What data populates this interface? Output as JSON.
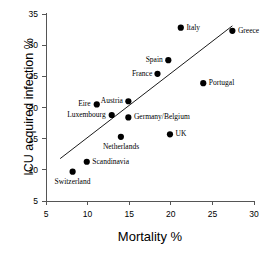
{
  "chart_data": {
    "type": "scatter",
    "title": "",
    "xlabel": "Mortality %",
    "ylabel": "ICU acquired infection %",
    "xlim": [
      5,
      30
    ],
    "ylim": [
      5,
      35
    ],
    "xticks": [
      5,
      10,
      15,
      20,
      25,
      30
    ],
    "yticks": [
      5,
      10,
      15,
      20,
      25,
      30,
      35
    ],
    "grid": false,
    "legend": false,
    "marker_color": "#000000",
    "line_color": "#000000",
    "points": [
      {
        "label": "Switzerland",
        "x": 8.2,
        "y": 9.7,
        "label_pos": "below"
      },
      {
        "label": "Scandinavia",
        "x": 9.9,
        "y": 11.3,
        "label_pos": "right"
      },
      {
        "label": "Eire",
        "x": 11.1,
        "y": 20.5,
        "label_pos": "left"
      },
      {
        "label": "Luxembourg",
        "x": 12.9,
        "y": 18.8,
        "label_pos": "left"
      },
      {
        "label": "Netherlands",
        "x": 14.0,
        "y": 15.3,
        "label_pos": "below"
      },
      {
        "label": "Austria",
        "x": 14.9,
        "y": 21.0,
        "label_pos": "left"
      },
      {
        "label": "Germany/Belgium",
        "x": 14.9,
        "y": 18.4,
        "label_pos": "right"
      },
      {
        "label": "France",
        "x": 18.4,
        "y": 25.4,
        "label_pos": "left"
      },
      {
        "label": "Spain",
        "x": 19.7,
        "y": 27.6,
        "label_pos": "left"
      },
      {
        "label": "UK",
        "x": 19.9,
        "y": 15.7,
        "label_pos": "right"
      },
      {
        "label": "Italy",
        "x": 21.2,
        "y": 32.8,
        "label_pos": "right"
      },
      {
        "label": "Portugal",
        "x": 23.9,
        "y": 23.9,
        "label_pos": "right"
      },
      {
        "label": "Greece",
        "x": 27.4,
        "y": 32.3,
        "label_pos": "right"
      }
    ],
    "trendline": {
      "x1": 6.7,
      "y1": 11.8,
      "x2": 27.4,
      "y2": 33.1
    }
  }
}
